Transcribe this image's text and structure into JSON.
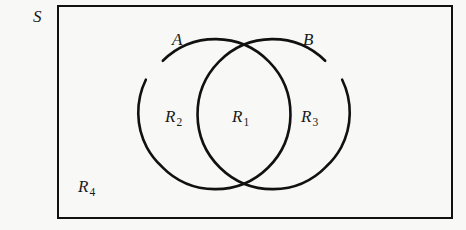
{
  "figure": {
    "type": "venn-diagram",
    "background_color": "#f8f8f6",
    "stroke_color": "#111111"
  },
  "universe": {
    "label": "S",
    "rect": {
      "x": 58,
      "y": 6,
      "width": 394,
      "height": 212
    }
  },
  "sets": [
    {
      "name": "set-a",
      "label": "A",
      "cx": 208,
      "cy": 113,
      "r": 75
    },
    {
      "name": "set-b",
      "label": "B",
      "cx": 280,
      "cy": 113,
      "r": 75
    }
  ],
  "regions": [
    {
      "name": "region-r1",
      "letter": "R",
      "subscript": "1",
      "meaning": "A intersect B"
    },
    {
      "name": "region-r2",
      "letter": "R",
      "subscript": "2",
      "meaning": "A minus B"
    },
    {
      "name": "region-r3",
      "letter": "R",
      "subscript": "3",
      "meaning": "B minus A"
    },
    {
      "name": "region-r4",
      "letter": "R",
      "subscript": "4",
      "meaning": "complement of A union B"
    }
  ]
}
